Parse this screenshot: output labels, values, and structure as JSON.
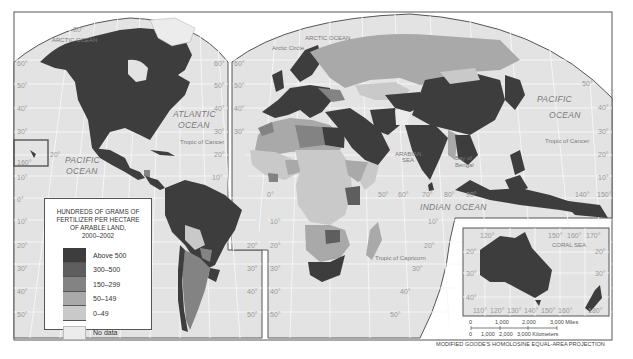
{
  "map": {
    "title": "Fertilizer use per hectare of arable land, 2000–2002",
    "projection_label": "MODIFIED GOODE'S HOMOLOSINE EQUAL-AREA PROJECTION",
    "colors": {
      "above_500": "#3d3d3d",
      "300_500": "#5e5e5e",
      "150_299": "#838383",
      "50_149": "#a9a9a9",
      "0_49": "#c9c9c9",
      "no_data": "#ececec",
      "ocean": "#e3e3e3",
      "graticule": "#f6f6f6",
      "frame": "#555555"
    },
    "ocean_labels": {
      "arctic_left": "ARCTIC OCEAN",
      "arctic_right": "ARCTIC OCEAN",
      "arctic_circle": "Arctic Circle",
      "atlantic_1": "ATLANTIC",
      "atlantic_2": "OCEAN",
      "pacific_left_1": "PACIFIC",
      "pacific_left_2": "OCEAN",
      "pacific_right_1": "PACIFIC",
      "pacific_right_2": "OCEAN",
      "indian_1": "INDIAN",
      "indian_2": "OCEAN",
      "arabian_sea_1": "ARABIAN",
      "arabian_sea_2": "SEA",
      "bay_of_bengal_1": "Bay of",
      "bay_of_bengal_2": "Bengal",
      "coral_sea": "CORAL SEA",
      "tropic_cancer_left": "Tropic of Cancer",
      "tropic_cancer_right": "Tropic of Cancer",
      "tropic_capricorn": "Tropic of Capricorn"
    },
    "latitude_labels": {
      "left": [
        "80°",
        "60°",
        "50°",
        "40°",
        "30°",
        "20°",
        "10°",
        "0°",
        "10°",
        "20°",
        "30°",
        "40°",
        "50°"
      ],
      "hawaii_inset": "160°",
      "americas_right": [
        "60°",
        "50°",
        "40°",
        "30°",
        "20°",
        "10°",
        "20°",
        "30°",
        "40°",
        "50°"
      ],
      "europe_left": [
        "60°",
        "50°",
        "40°",
        "30°"
      ],
      "africa_left": [
        "0°",
        "10°",
        "20°",
        "30°",
        "40°",
        "50°"
      ],
      "africa_right": [
        "10°",
        "20°",
        "30°",
        "40°",
        "50°"
      ],
      "longitudes_indian": [
        "50°",
        "60°",
        "70°",
        "80°",
        "90°"
      ],
      "asia_right": [
        "50°",
        "40°",
        "30°",
        "20°",
        "10°"
      ],
      "asia_longitudes": [
        "140°",
        "150°"
      ]
    }
  },
  "legend": {
    "title_line1": "HUNDREDS OF GRAMS OF",
    "title_line2": "FERTILIZER PER HECTARE",
    "title_line3": "OF ARABLE LAND,",
    "title_line4": "2000–2002",
    "items": [
      {
        "label": "Above 500",
        "color": "#3d3d3d"
      },
      {
        "label": "300–500",
        "color": "#5e5e5e"
      },
      {
        "label": "150–299",
        "color": "#838383"
      },
      {
        "label": "50–149",
        "color": "#a9a9a9"
      },
      {
        "label": "0–49",
        "color": "#c9c9c9"
      },
      {
        "label": "No data",
        "color": "#ececec"
      }
    ]
  },
  "australia_inset": {
    "top_longitudes": [
      "120°",
      "150°",
      "160°",
      "170°"
    ],
    "bottom_longitudes": [
      "110°",
      "120°",
      "130°",
      "140°",
      "150°",
      "160°",
      "180°"
    ],
    "latitudes_left": [
      "20°",
      "30°",
      "40°"
    ],
    "latitudes_right": [
      "20°",
      "30°"
    ],
    "sea_label": "CORAL SEA"
  },
  "scale_bar": {
    "miles_ticks": [
      "0",
      "1,000",
      "2,000",
      "3,000 Miles"
    ],
    "km_ticks": [
      "0",
      "1,000",
      "2,000",
      "3,000 Kilometers"
    ]
  }
}
